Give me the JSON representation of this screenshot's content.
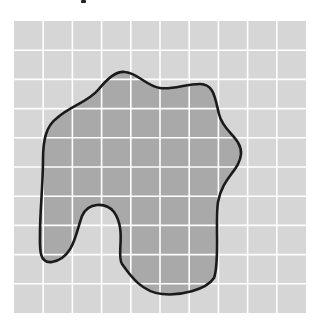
{
  "diagram": {
    "type": "area-estimation-grid",
    "grid": {
      "origin_x": 14,
      "origin_y": 21,
      "cell_size": 29.2,
      "columns": 10,
      "rows": 10,
      "cell_color": "#d6d6d6",
      "line_color": "#ffffff"
    },
    "shape": {
      "fill_color": "#a9a9a9",
      "stroke_color": "#1a1a1a",
      "stroke_width": 2.6,
      "path": "M 57 118 C 70 106, 88 102, 98 90 C 108 78, 116 71, 125 72 C 138 73, 146 86, 160 88 C 172 90, 186 84, 200 84 C 214 84, 215 98, 219 114 C 223 132, 242 138, 241 154 C 240 170, 222 178, 218 202 C 215 222, 220 262, 214 278 C 206 290, 180 296, 162 294 C 140 292, 128 272, 122 264 C 116 256, 127 230, 114 212 C 106 202, 88 202, 82 216 C 76 232, 74 258, 52 262 C 38 264, 40 246, 40 232 C 40 212, 43 184, 43 160 C 43 140, 46 126, 57 118 Z"
    },
    "top_mark_color": "#222222"
  }
}
